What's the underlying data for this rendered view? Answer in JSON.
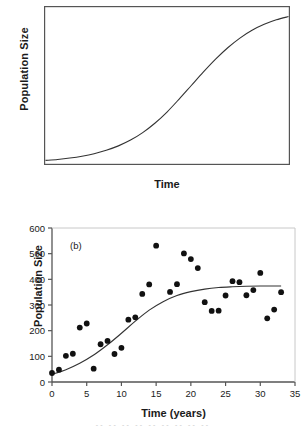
{
  "figure": {
    "background": "#ffffff",
    "ink": "#1a1a1a",
    "bottom_strip_text": "-- -- -- -- -- -- -- -- --"
  },
  "panel_a": {
    "tag": "(a)",
    "ylabel": "Population Size",
    "xlabel": "Time"
  },
  "panel_b": {
    "tag": "(b)",
    "ylabel": "Population Size",
    "xlabel": "Time (years)"
  },
  "chart_data": [
    {
      "id": "panel-a",
      "type": "line",
      "title": "(a)",
      "xlabel": "Time",
      "ylabel": "Population Size",
      "xlim": [
        0,
        100
      ],
      "ylim": [
        0,
        100
      ],
      "xticks": [],
      "yticks": [],
      "grid": false,
      "legend": null,
      "annotations": [
        "(a)"
      ],
      "description": "Idealized logistic (sigmoid) growth curve rising from near zero to a plateau (carrying capacity).",
      "series": [
        {
          "name": "logistic growth curve",
          "color": "#1a1a1a",
          "x": [
            0,
            5,
            10,
            15,
            20,
            25,
            30,
            35,
            40,
            45,
            50,
            55,
            60,
            65,
            70,
            75,
            80,
            85,
            90,
            95,
            100
          ],
          "y": [
            2,
            2.6,
            3.5,
            4.7,
            6.3,
            8.5,
            11.3,
            15.0,
            19.8,
            25.8,
            33.0,
            41.3,
            50.0,
            58.7,
            66.9,
            74.2,
            80.4,
            85.4,
            89.2,
            92.1,
            94.2
          ]
        }
      ]
    },
    {
      "id": "panel-b",
      "type": "scatter",
      "title": "(b)",
      "xlabel": "Time (years)",
      "ylabel": "Population Size",
      "xlim": [
        0,
        35
      ],
      "ylim": [
        0,
        600
      ],
      "xticks": [
        0,
        5,
        10,
        15,
        20,
        25,
        30,
        35
      ],
      "yticks": [
        0,
        100,
        200,
        300,
        400,
        500,
        600
      ],
      "grid": false,
      "legend": null,
      "annotations": [
        "(b)"
      ],
      "description": "Observed population size versus time with a fitted logistic growth curve.",
      "series": [
        {
          "name": "observed population size",
          "type": "scatter",
          "marker": "filled-circle",
          "color": "#111111",
          "points": [
            {
              "x": 0,
              "y": 35
            },
            {
              "x": 1,
              "y": 48
            },
            {
              "x": 2,
              "y": 102
            },
            {
              "x": 3,
              "y": 110
            },
            {
              "x": 4,
              "y": 212
            },
            {
              "x": 5,
              "y": 228
            },
            {
              "x": 6,
              "y": 52
            },
            {
              "x": 7,
              "y": 147
            },
            {
              "x": 8,
              "y": 160
            },
            {
              "x": 9,
              "y": 109
            },
            {
              "x": 10,
              "y": 133
            },
            {
              "x": 11,
              "y": 243
            },
            {
              "x": 12,
              "y": 252
            },
            {
              "x": 13,
              "y": 343
            },
            {
              "x": 14,
              "y": 380
            },
            {
              "x": 15,
              "y": 531
            },
            {
              "x": 17,
              "y": 351
            },
            {
              "x": 18,
              "y": 381
            },
            {
              "x": 19,
              "y": 501
            },
            {
              "x": 20,
              "y": 479
            },
            {
              "x": 21,
              "y": 444
            },
            {
              "x": 22,
              "y": 311
            },
            {
              "x": 23,
              "y": 277
            },
            {
              "x": 24,
              "y": 278
            },
            {
              "x": 25,
              "y": 337
            },
            {
              "x": 26,
              "y": 393
            },
            {
              "x": 27,
              "y": 389
            },
            {
              "x": 28,
              "y": 338
            },
            {
              "x": 29,
              "y": 358
            },
            {
              "x": 30,
              "y": 425
            },
            {
              "x": 31,
              "y": 248
            },
            {
              "x": 32,
              "y": 282
            },
            {
              "x": 33,
              "y": 350
            }
          ]
        },
        {
          "name": "fitted logistic curve",
          "type": "line",
          "color": "#333333",
          "x": [
            0,
            2,
            4,
            6,
            8,
            10,
            12,
            14,
            16,
            18,
            20,
            22,
            24,
            26,
            28,
            30,
            32,
            33
          ],
          "y": [
            30,
            48,
            73,
            105,
            145,
            190,
            237,
            280,
            313,
            337,
            352,
            362,
            368,
            371,
            373,
            374,
            374,
            374
          ]
        }
      ]
    }
  ]
}
